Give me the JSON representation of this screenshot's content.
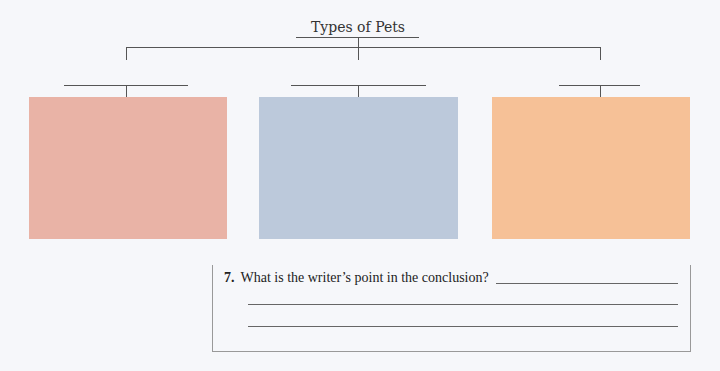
{
  "diagram": {
    "title": "Types of Pets",
    "boxes": [
      {
        "label": "",
        "color": "#E9B3A6"
      },
      {
        "label": "",
        "color": "#BCC9DB"
      },
      {
        "label": "",
        "color": "#F6C197"
      }
    ]
  },
  "question": {
    "number": "7.",
    "text": "What is the writer’s point in the conclusion?",
    "answer_lines": 3
  }
}
